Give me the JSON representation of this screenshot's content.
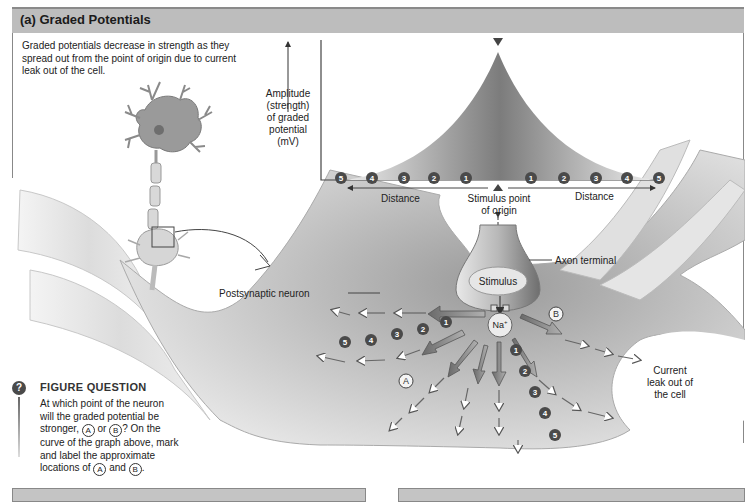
{
  "figure": {
    "header_title": "(a) Graded Potentials",
    "intro_text": "Graded potentials decrease in strength as they spread out from the point of origin due to current leak out of the cell.",
    "graph": {
      "y_axis_label_lines": [
        "Amplitude",
        "(strength)",
        "of graded",
        "potential",
        "(mV)"
      ],
      "x_left_label": "Distance",
      "x_right_label": "Distance",
      "origin_label_line1": "Stimulus point",
      "origin_label_line2": "of origin",
      "left_markers": [
        "5",
        "4",
        "3",
        "2",
        "1"
      ],
      "right_markers": [
        "1",
        "2",
        "3",
        "4",
        "5"
      ]
    },
    "labels": {
      "axon_terminal": "Axon terminal",
      "stimulus": "Stimulus",
      "sodium": "Na",
      "sodium_charge": "+",
      "postsynaptic_neuron": "Postsynaptic neuron",
      "current_leak_line1": "Current",
      "current_leak_line2": "leak out of",
      "current_leak_line3": "the cell",
      "point_a": "A",
      "point_b": "B"
    },
    "left_branch_numbers": [
      "1",
      "2",
      "3",
      "4",
      "5"
    ],
    "down_branch_numbers": [
      "1",
      "2",
      "3",
      "4",
      "5"
    ],
    "figure_question": {
      "icon": "?",
      "title": "FIGURE QUESTION",
      "line1": "At which point of the neuron",
      "line2": "will the graded potential be",
      "line3_pre": "stronger,",
      "line3_a": "A",
      "line3_mid": "or",
      "line3_b": "B",
      "line3_post": "? On the",
      "line4": "curve of the graph above, mark",
      "line5": "and label the approximate",
      "line6_pre": "locations of",
      "line6_a": "A",
      "line6_mid": "and",
      "line6_b": "B",
      "line6_post": "."
    },
    "colors": {
      "header_bg": "#bdbdbd",
      "marker_fill": "#4a4a4a",
      "curve_fill_dark": "#7a7a7a",
      "neuron_fill": "#cfcfcf"
    }
  }
}
